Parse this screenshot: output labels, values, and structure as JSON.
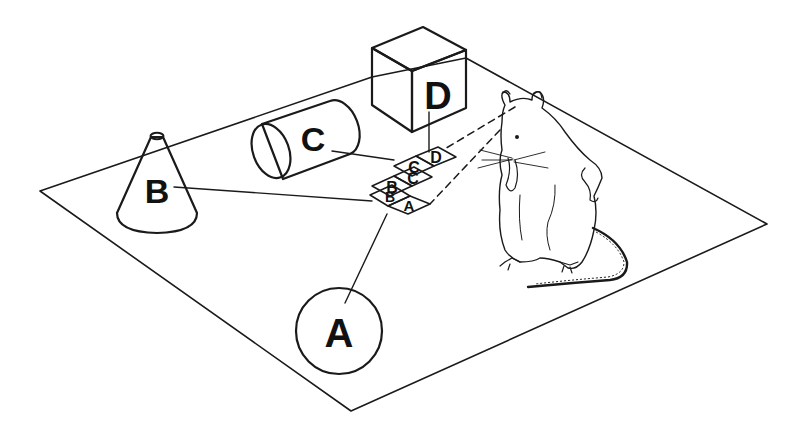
{
  "figure": {
    "colors": {
      "ink": "#1a1a1a",
      "background": "#ffffff"
    }
  },
  "objects": {
    "cone": {
      "label": "B",
      "shape": "cone"
    },
    "cylinder": {
      "label": "C",
      "shape": "cylinder"
    },
    "cube": {
      "label": "D",
      "shape": "cube"
    },
    "disc": {
      "label": "A",
      "shape": "circle"
    }
  },
  "cards": {
    "top_row": [
      "C",
      "D"
    ],
    "middle_row": [
      "B",
      "C"
    ],
    "bottom_row": [
      "B",
      "A"
    ]
  },
  "observer": {
    "name": "rat",
    "gaze": "dashed sight lines to the card array"
  }
}
